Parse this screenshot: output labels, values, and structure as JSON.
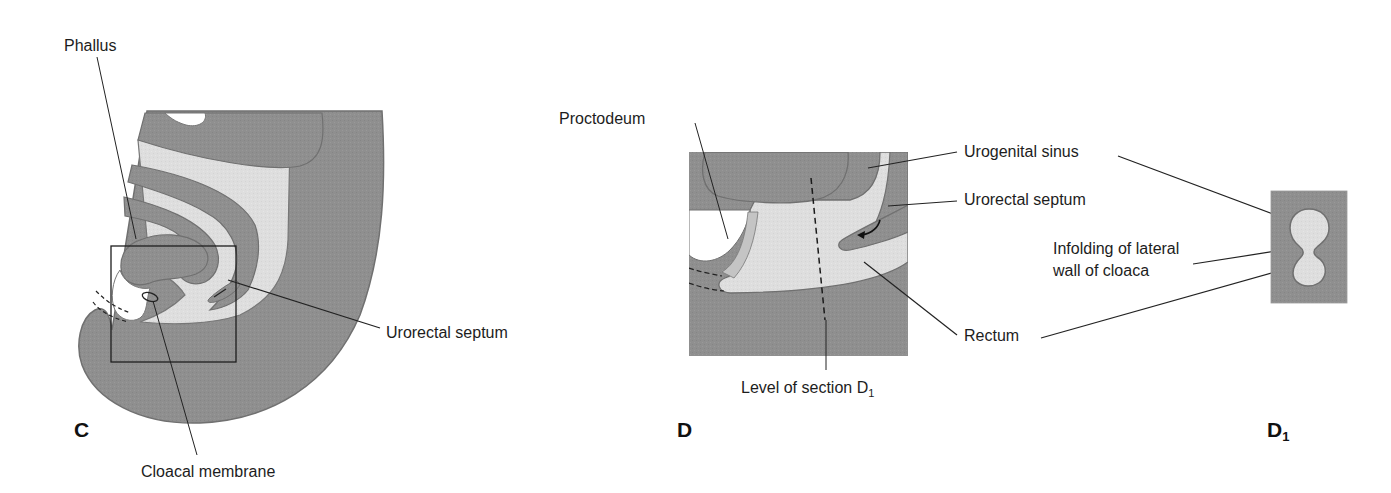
{
  "figure": {
    "panels": [
      {
        "id": "C",
        "letter": "C",
        "subscript": ""
      },
      {
        "id": "D",
        "letter": "D",
        "subscript": ""
      },
      {
        "id": "D1",
        "letter": "D",
        "subscript": "1"
      }
    ],
    "colors": {
      "dark_tissue": "#8e8e8e",
      "light_tissue": "#dcdcdc",
      "outline": "#6f6f6f",
      "leader_line": "#222222",
      "background": "#ffffff"
    }
  },
  "labels": {
    "phallus": "Phallus",
    "cloacal_membrane": "Cloacal membrane",
    "urorectal_septum_c": "Urorectal septum",
    "proctodeum": "Proctodeum",
    "urogenital_sinus": "Urogenital sinus",
    "urorectal_septum_d": "Urorectal septum",
    "rectum": "Rectum",
    "level_of_section": "Level of section D",
    "level_of_section_sub": "1",
    "infolding_line1": "Infolding of lateral",
    "infolding_line2": "wall of cloaca"
  }
}
